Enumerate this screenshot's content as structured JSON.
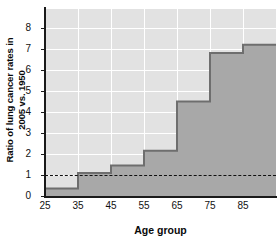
{
  "chart_data": {
    "type": "area",
    "title": "",
    "xlabel": "Age group",
    "ylabel_line1": "Ratio of lung cancer rates in",
    "ylabel_line2": "2005 vs. 1950",
    "categories": [
      "25",
      "35",
      "45",
      "55",
      "65",
      "75",
      "85"
    ],
    "x": [
      25,
      35,
      45,
      55,
      65,
      75,
      85,
      95
    ],
    "values": [
      0.35,
      1.1,
      1.45,
      2.15,
      4.5,
      6.8,
      7.2
    ],
    "xtick_labels": [
      "25",
      "35",
      "45",
      "55",
      "65",
      "75",
      "85"
    ],
    "xtick_values": [
      25,
      35,
      45,
      55,
      65,
      75,
      85
    ],
    "ytick_labels": [
      "0",
      "1",
      "2",
      "3",
      "4",
      "5",
      "6",
      "7",
      "8"
    ],
    "ytick_values": [
      0,
      1,
      2,
      3,
      4,
      5,
      6,
      7,
      8
    ],
    "xlim": [
      25,
      95
    ],
    "ylim": [
      0,
      8.9
    ],
    "grid": true,
    "legend": "none",
    "reference_line": {
      "value": 1,
      "style": "dashed",
      "color": "#101010"
    },
    "colors": {
      "area_fill": "#a8a8a8",
      "area_edge": "#6e6e6e",
      "plot_background": "#e2e2e2",
      "gridline": "#ffffff",
      "axis": "#1a1a1a",
      "text": "#111111"
    }
  }
}
